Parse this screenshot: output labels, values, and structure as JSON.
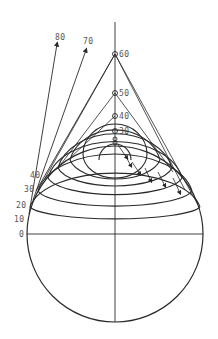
{
  "diagram": {
    "title": "",
    "colors": {
      "line": "#2a2a2a",
      "label": "#555555",
      "background": "#ffffff"
    },
    "sphere": {
      "cx": 115,
      "cy": 234,
      "r": 88
    },
    "axis_points": [
      {
        "label": "60",
        "y": 54
      },
      {
        "label": "50",
        "y": 93
      },
      {
        "label": "40",
        "y": 116
      },
      {
        "label": "30",
        "y": 131
      },
      {
        "label": "",
        "y": 139
      },
      {
        "label": "",
        "y": 143
      }
    ],
    "edge_labels": [
      {
        "label": "40",
        "x": 4,
        "y": 178
      },
      {
        "label": "30",
        "x": 4,
        "y": 191
      },
      {
        "label": "20",
        "x": 4,
        "y": 207
      },
      {
        "label": "10",
        "x": 4,
        "y": 222
      },
      {
        "label": "0",
        "x": 4,
        "y": 237
      }
    ],
    "ray_labels": [
      {
        "label": "80",
        "x": 54,
        "y": 40
      },
      {
        "label": "70",
        "x": 83,
        "y": 44
      }
    ]
  }
}
